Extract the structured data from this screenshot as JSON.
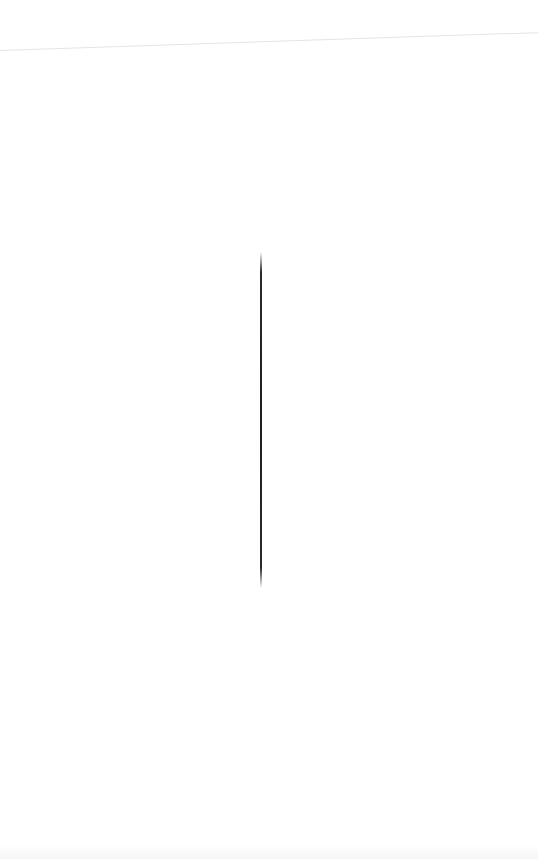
{
  "page": {
    "background_color": "#ffffff",
    "header_divider_color": "#e4e4e4",
    "cursor_color": "#1e1e1e"
  },
  "document": {
    "text": ""
  }
}
